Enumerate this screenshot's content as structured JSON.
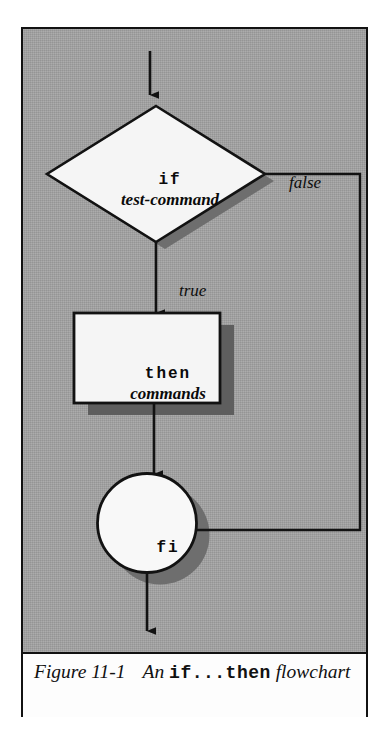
{
  "figure": {
    "caption_label": "Figure 11-1",
    "caption_lead": "An",
    "caption_code": "if...then",
    "caption_tail": "flowchart"
  },
  "diagram": {
    "type": "flowchart",
    "background_color": "#a2a2a2",
    "line_color": "#121212",
    "shape_fill": "#f5f5f5",
    "shadow_color": "#6b6b6b",
    "nodes": [
      {
        "id": "decision",
        "shape": "diamond",
        "line1": "if",
        "line2": "test-command",
        "line1_style": "mono-bold",
        "line2_style": "serif-bold-italic"
      },
      {
        "id": "process",
        "shape": "rectangle",
        "line1": "then",
        "line2": "commands",
        "line1_style": "mono-bold",
        "line2_style": "serif-bold-italic"
      },
      {
        "id": "terminator",
        "shape": "circle",
        "line1": "fi",
        "line1_style": "mono-bold"
      }
    ],
    "edges": [
      {
        "id": "entry",
        "from": "start",
        "to": "decision",
        "label": ""
      },
      {
        "id": "true-branch",
        "from": "decision",
        "to": "process",
        "label": "true"
      },
      {
        "id": "false-branch",
        "from": "decision",
        "to": "terminator",
        "label": "false"
      },
      {
        "id": "process-to-fi",
        "from": "process",
        "to": "terminator",
        "label": ""
      },
      {
        "id": "exit",
        "from": "terminator",
        "to": "end",
        "label": ""
      }
    ]
  }
}
